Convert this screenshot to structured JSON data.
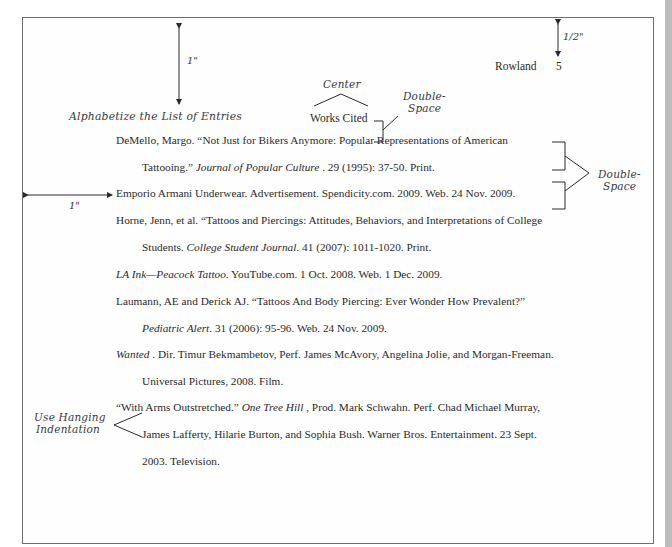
{
  "header": {
    "surname": "Rowland",
    "page_number": "5"
  },
  "title": "Works Cited",
  "annotations": {
    "top_margin": "1\"",
    "header_margin": "1/2\"",
    "left_margin": "1\"",
    "center": "Center",
    "double_space_title_line1": "Double-",
    "double_space_title_line2": "Space",
    "double_space_entries_line1": "Double-",
    "double_space_entries_line2": "Space",
    "alphabetize": "Alphabetize the List of Entries",
    "hanging_line1": "Use Hanging",
    "hanging_line2": "Indentation"
  },
  "entries": [
    {
      "lines": [
        {
          "pre": "DeMello, Margo. “Not Just for Bikers Anymore: Popular Representations of American",
          "ital": "",
          "post": ""
        },
        {
          "pre": "Tattooing.”  ",
          "ital": "Journal of Popular Culture",
          "post": " . 29 (1995): 37-50. Print."
        }
      ]
    },
    {
      "lines": [
        {
          "pre": "Emporio Armani Underwear. Advertisement. Spendicity.com. 2009. Web. 24 Nov. 2009.",
          "ital": "",
          "post": ""
        }
      ]
    },
    {
      "lines": [
        {
          "pre": "Horne, Jenn, et al. “Tattoos and Piercings: Attitudes, Behaviors, and Interpretations of College",
          "ital": "",
          "post": ""
        },
        {
          "pre": "Students. ",
          "ital": "College Student Journal.",
          "post": "  41 (2007): 1011-1020. Print."
        }
      ]
    },
    {
      "lines": [
        {
          "pre": "",
          "ital": "LA Ink—Peacock Tattoo",
          "post": ". YouTube.com. 1 Oct. 2008. Web. 1 Dec. 2009."
        }
      ]
    },
    {
      "lines": [
        {
          "pre": "Laumann, AE and Derick AJ. “Tattoos And Body Piercing: Ever Wonder How Prevalent?”",
          "ital": "",
          "post": ""
        },
        {
          "pre": "",
          "ital": "Pediatric Alert",
          "post": ". 31 (2006): 95-96. Web. 24 Nov. 2009."
        }
      ]
    },
    {
      "lines": [
        {
          "pre": "",
          "ital": "Wanted",
          "post": " . Dir. Timur Bekmambetov, Perf. James McAvory, Angelina Jolie, and Morgan-Freeman."
        },
        {
          "pre": "Universal Pictures, 2008. Film.",
          "ital": "",
          "post": ""
        }
      ]
    },
    {
      "lines": [
        {
          "pre": "“With Arms Outstretched.”  ",
          "ital": "One Tree Hill",
          "post": " , Prod. Mark Schwahn. Perf. Chad Michael Murray,"
        },
        {
          "pre": "James Lafferty, Hilarie Burton, and Sophia Bush. Warner Bros. Entertainment. 23 Sept.",
          "ital": "",
          "post": ""
        },
        {
          "pre": "2003. Television.",
          "ital": "",
          "post": ""
        }
      ]
    }
  ]
}
